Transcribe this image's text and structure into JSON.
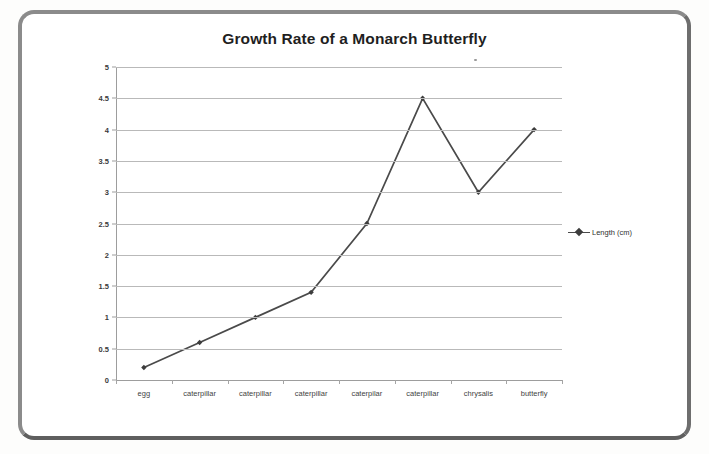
{
  "chart_data": {
    "type": "line",
    "title": "Growth Rate of a Monarch Butterfly",
    "xlabel": "",
    "ylabel": "",
    "categories": [
      "egg",
      "caterpillar",
      "caterpillar",
      "caterpillar",
      "caterpilar",
      "caterpillar",
      "chrysalis",
      "butterfly"
    ],
    "series": [
      {
        "name": "Length (cm)",
        "values": [
          0.2,
          0.6,
          1,
          1.4,
          2.5,
          4.5,
          3,
          4
        ]
      }
    ],
    "ylim": [
      0,
      5
    ],
    "ytick_values": [
      0,
      0.5,
      1,
      1.5,
      2,
      2.5,
      3,
      3.5,
      4,
      4.5,
      5
    ],
    "ytick_labels": [
      "0",
      "0.5",
      "1",
      "1.5",
      "2",
      "2.5",
      "3",
      "3.5",
      "4",
      "4.5",
      "5"
    ],
    "grid": true,
    "legend_position": "right",
    "line_color": "#4a4a4a",
    "marker_color": "#3d3d3d",
    "gridline_color": "#b9b9b9",
    "axis_color": "#9d9d9d",
    "title_color": "#1f1f1f",
    "plot_background": "#ffffff"
  },
  "legend": {
    "entries": [
      {
        "label": "Length (cm)",
        "marker": "line-diamond-marker"
      }
    ]
  },
  "frame": {
    "border_color": "#8b8b8b",
    "background": "#ffffff"
  }
}
